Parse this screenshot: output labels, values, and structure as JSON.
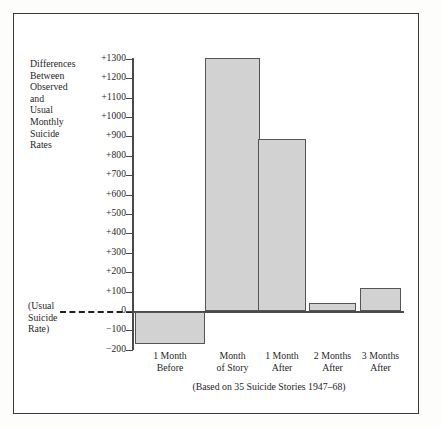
{
  "figure": {
    "caption": "(Based on 35 Suicide Stories 1947–68)",
    "y_axis_title_lines": [
      "Differences",
      "Between",
      "Observed",
      "and",
      "Usual",
      "Monthly",
      "Suicide",
      "Rates"
    ],
    "baseline_label_lines": [
      "(Usual",
      "Suicide",
      "Rate)"
    ],
    "frame_color": "#3a3a3a",
    "bar_fill": "#d2d2d2",
    "bar_stroke": "#555555",
    "background": "#ffffff"
  },
  "chart_data": {
    "type": "bar",
    "title": "",
    "subtitle": "",
    "xlabel": "",
    "ylabel": "Differences Between Observed and Usual Monthly Suicide Rates",
    "categories": [
      "1 Month Before",
      "Month of Story",
      "1 Month After",
      "2 Months After",
      "3 Months After"
    ],
    "category_lines": [
      [
        "1 Month",
        "Before"
      ],
      [
        "Month",
        "of Story"
      ],
      [
        "1 Month",
        "After"
      ],
      [
        "2 Months",
        "After"
      ],
      [
        "3 Months",
        "After"
      ]
    ],
    "values": [
      -165,
      1305,
      890,
      45,
      120
    ],
    "ylim": [
      -200,
      1300
    ],
    "ytick_values": [
      1300,
      1200,
      1100,
      1000,
      900,
      800,
      700,
      600,
      500,
      400,
      300,
      200,
      100,
      0,
      -100,
      -200
    ],
    "ytick_labels": [
      "+1300",
      "+1200",
      "+1100",
      "+1000",
      "+900",
      "+800",
      "+700",
      "+600",
      "+500",
      "+400",
      "+300",
      "+200",
      "+100",
      "0",
      "−100",
      "−200"
    ],
    "grid": false,
    "legend": null,
    "baseline": 0,
    "baseline_style": "dashed",
    "annotation": "(Based on 35 Suicide Stories 1947–68)"
  }
}
